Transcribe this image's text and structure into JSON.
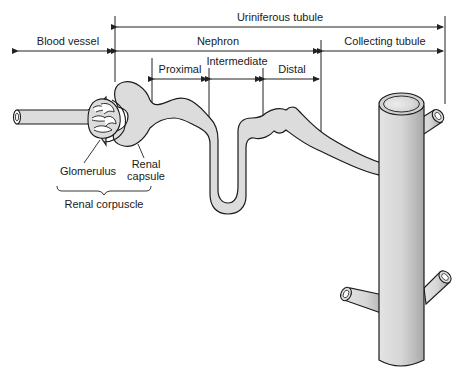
{
  "diagram": {
    "regions": {
      "uriniferous_tubule": "Uriniferous tubule",
      "blood_vessel": "Blood vessel",
      "nephron": "Nephron",
      "collecting_tubule": "Collecting tubule",
      "proximal": "Proximal",
      "intermediate": "Intermediate",
      "distal": "Distal"
    },
    "parts": {
      "glomerulus": "Glomerulus",
      "renal_capsule_line1": "Renal",
      "renal_capsule_line2": "capsule",
      "renal_corpuscle": "Renal corpuscle"
    },
    "colors": {
      "tubule_fill": "#dcdcdc",
      "outline": "#1a1a1a",
      "line": "#333333"
    }
  }
}
